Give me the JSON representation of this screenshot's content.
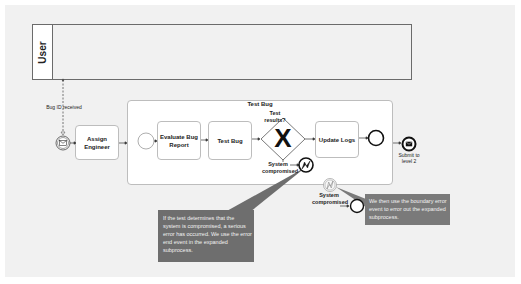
{
  "pool": {
    "label": "User"
  },
  "message_flow": {
    "label": "Bug ID received"
  },
  "start_event": {
    "icon": "envelope-icon"
  },
  "tasks": {
    "assign_engineer": "Assign Engineer",
    "evaluate_bug_report": "Evaluate Bug Report",
    "test_bug": "Test Bug",
    "update_logs": "Update Logs"
  },
  "subprocess": {
    "title": "Test Bug"
  },
  "gateway": {
    "label": "Test results?",
    "symbol": "X"
  },
  "error_end_event": {
    "label": "System compromised",
    "icon": "lightning-icon"
  },
  "boundary_error_event": {
    "label": "System compromised",
    "icon": "lightning-icon"
  },
  "message_end_event": {
    "label": "Submit to level 2",
    "icon": "envelope-icon"
  },
  "callouts": {
    "error_end": "If the test determines that the system is compromised, a serious error has occurred. We use the error end event in the expanded subprocess.",
    "boundary": "We then use the boundary error event to error out the expanded subprocess."
  },
  "colors": {
    "canvas": "#f1f1f1",
    "callout_dark": "#6e6e6e",
    "callout_light": "#7a7a7a",
    "stroke": "#222222"
  }
}
